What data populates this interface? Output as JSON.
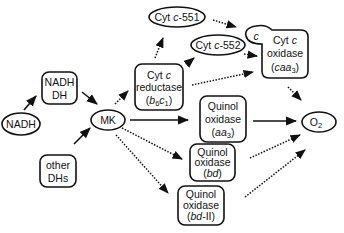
{
  "diagram": {
    "type": "electron-transport-pathway",
    "nodes": {
      "nadh": {
        "label": "NADH",
        "shape": "ellipse"
      },
      "nadh_dh": {
        "line1": "NADH",
        "line2": "DH",
        "shape": "rounded-rect"
      },
      "other_dhs": {
        "line1": "other",
        "line2": "DHs",
        "shape": "rounded-rect"
      },
      "mk": {
        "label": "MK",
        "shape": "ellipse"
      },
      "cyt_c_reductase": {
        "line1_a": "Cyt ",
        "line1_b": "c",
        "line2": "reductase",
        "line3_open": "(",
        "line3_b": "b",
        "line3_6": "6",
        "line3_c": "c",
        "line3_1": "1",
        "line3_close": ")",
        "shape": "rounded-rect"
      },
      "cyt_c551": {
        "prefix": "Cyt ",
        "italic": "c",
        "suffix": "-551",
        "shape": "ellipse"
      },
      "cyt_c552": {
        "prefix": "Cyt ",
        "italic": "c",
        "suffix": "-552",
        "shape": "ellipse"
      },
      "cyt_c_oxidase": {
        "tab": "c",
        "line1_a": "Cyt ",
        "line1_b": "c",
        "line2": "oxidase",
        "line3_open": "(",
        "line3_italic": "caa",
        "line3_sub": "3",
        "line3_close": ")",
        "shape": "rounded-rect-with-tab"
      },
      "quinol_oxidase_aa3": {
        "line1": "Quinol",
        "line2": "oxidase",
        "line3_open": "(",
        "line3_italic": "aa",
        "line3_sub": "3",
        "line3_close": ")",
        "shape": "rounded-rect"
      },
      "quinol_oxidase_bd": {
        "line1": "Quinol",
        "line2": "oxidase",
        "line3_open": "(",
        "line3_italic": "bd",
        "line3_close": ")",
        "shape": "rounded-rect"
      },
      "quinol_oxidase_bd2": {
        "line1": "Quinol",
        "line2": "oxidase",
        "line3_open": "(",
        "line3_italic": "bd",
        "line3_rest": "-II)",
        "shape": "rounded-rect"
      },
      "o2": {
        "label": "O",
        "sub": "2",
        "shape": "ellipse"
      }
    },
    "edges": [
      {
        "from": "NADH",
        "to": "NADH DH",
        "style": "solid"
      },
      {
        "from": "NADH DH",
        "to": "MK",
        "style": "solid"
      },
      {
        "from": "other DHs",
        "to": "MK",
        "style": "solid"
      },
      {
        "from": "MK",
        "to": "Cyt c reductase (b6c1)",
        "style": "dotted"
      },
      {
        "from": "MK",
        "to": "Quinol oxidase (aa3)",
        "style": "solid"
      },
      {
        "from": "MK",
        "to": "Quinol oxidase (bd)",
        "style": "dotted"
      },
      {
        "from": "MK",
        "to": "Quinol oxidase (bd-II)",
        "style": "dotted"
      },
      {
        "from": "Cyt c reductase (b6c1)",
        "to": "Cyt c-551",
        "style": "dotted"
      },
      {
        "from": "Cyt c reductase (b6c1)",
        "to": "Cyt c-552",
        "style": "solid"
      },
      {
        "from": "Cyt c reductase (b6c1)",
        "to": "Cyt c oxidase (caa3)",
        "style": "dotted"
      },
      {
        "from": "Cyt c-551",
        "to": "Cyt c oxidase (caa3)",
        "style": "dotted"
      },
      {
        "from": "Cyt c-552",
        "to": "Cyt c oxidase (caa3)",
        "style": "dotted"
      },
      {
        "from": "Cyt c oxidase (caa3)",
        "to": "O2",
        "style": "dotted"
      },
      {
        "from": "Quinol oxidase (aa3)",
        "to": "O2",
        "style": "solid"
      },
      {
        "from": "Quinol oxidase (bd)",
        "to": "O2",
        "style": "dotted"
      },
      {
        "from": "Quinol oxidase (bd-II)",
        "to": "O2",
        "style": "dotted"
      }
    ]
  }
}
